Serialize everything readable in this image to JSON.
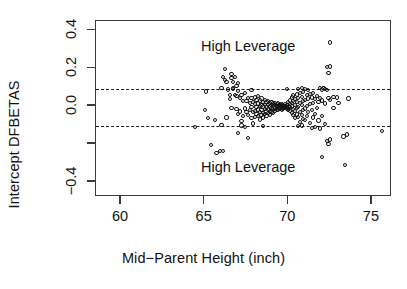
{
  "chart_data": {
    "type": "scatter",
    "title": "",
    "xlabel": "Mid−Parent Height (inch)",
    "ylabel": "Intercept DFBETAS",
    "xlim": [
      58.5,
      76.2
    ],
    "ylim": [
      -0.48,
      0.45
    ],
    "xticks": [
      60,
      65,
      70,
      75
    ],
    "xticklabels": [
      "60",
      "65",
      "70",
      "75"
    ],
    "yticks": [
      0.4,
      0.2,
      0.0,
      -0.2,
      -0.4
    ],
    "yticklabels": [
      "0.4",
      "0.2",
      "0.0",
      "",
      "−0.4"
    ],
    "grid": false,
    "legend": null,
    "marker": "open-circle",
    "annotations": [
      {
        "text": "High Leverage",
        "x": 67.6,
        "y": 0.315
      },
      {
        "text": "High Leverage",
        "x": 67.6,
        "y": -0.325
      }
    ],
    "reference_lines": [
      {
        "orientation": "horizontal",
        "y": 0.089,
        "style": "dashed"
      },
      {
        "orientation": "horizontal",
        "y": -0.104,
        "style": "dashed"
      }
    ],
    "points": [
      [
        64.4,
        -0.112
      ],
      [
        65.1,
        0.077
      ],
      [
        65.0,
        -0.021
      ],
      [
        65.2,
        -0.062
      ],
      [
        65.4,
        -0.205
      ],
      [
        65.6,
        -0.075
      ],
      [
        65.7,
        -0.247
      ],
      [
        65.9,
        -0.238
      ],
      [
        66.0,
        -0.098
      ],
      [
        66.1,
        -0.237
      ],
      [
        66.2,
        0.196
      ],
      [
        66.1,
        0.152
      ],
      [
        66.2,
        0.138
      ],
      [
        66.3,
        0.126
      ],
      [
        66.4,
        0.088
      ],
      [
        66.3,
        -0.06
      ],
      [
        66.5,
        0.06
      ],
      [
        66.6,
        0.17
      ],
      [
        66.6,
        0.15
      ],
      [
        66.5,
        0.036
      ],
      [
        66.6,
        -0.008
      ],
      [
        66.7,
        0.128
      ],
      [
        66.7,
        0.094
      ],
      [
        66.8,
        0.154
      ],
      [
        66.8,
        0.058
      ],
      [
        66.9,
        0.105
      ],
      [
        66.9,
        -0.016
      ],
      [
        67.0,
        0.082
      ],
      [
        67.0,
        -0.041
      ],
      [
        67.0,
        -0.14
      ],
      [
        67.1,
        0.044
      ],
      [
        67.1,
        -0.028
      ],
      [
        67.2,
        0.06
      ],
      [
        67.2,
        -0.078
      ],
      [
        67.3,
        0.026
      ],
      [
        67.3,
        -0.05
      ],
      [
        67.4,
        0.068
      ],
      [
        67.4,
        -0.012
      ],
      [
        67.4,
        -0.109
      ],
      [
        67.5,
        0.028
      ],
      [
        67.5,
        -0.03
      ],
      [
        67.6,
        0.044
      ],
      [
        67.6,
        -0.046
      ],
      [
        67.6,
        -0.17
      ],
      [
        67.7,
        0.016
      ],
      [
        67.7,
        -0.022
      ],
      [
        67.8,
        0.042
      ],
      [
        67.8,
        -0.006
      ],
      [
        67.8,
        -0.064
      ],
      [
        67.9,
        0.024
      ],
      [
        67.9,
        -0.032
      ],
      [
        67.9,
        -0.092
      ],
      [
        68.0,
        0.046
      ],
      [
        68.0,
        0.01
      ],
      [
        68.0,
        -0.024
      ],
      [
        68.0,
        -0.058
      ],
      [
        68.1,
        0.032
      ],
      [
        68.1,
        -0.004
      ],
      [
        68.1,
        -0.04
      ],
      [
        68.2,
        0.052
      ],
      [
        68.2,
        0.014
      ],
      [
        68.2,
        -0.018
      ],
      [
        68.2,
        -0.052
      ],
      [
        68.3,
        0.03
      ],
      [
        68.3,
        0.002
      ],
      [
        68.3,
        -0.03
      ],
      [
        68.3,
        -0.07
      ],
      [
        68.4,
        0.04
      ],
      [
        68.4,
        0.008
      ],
      [
        68.4,
        -0.02
      ],
      [
        68.4,
        -0.048
      ],
      [
        68.5,
        0.022
      ],
      [
        68.5,
        -0.002
      ],
      [
        68.5,
        -0.034
      ],
      [
        68.5,
        -0.06
      ],
      [
        68.6,
        0.034
      ],
      [
        68.6,
        0.006
      ],
      [
        68.6,
        -0.016
      ],
      [
        68.6,
        -0.042
      ],
      [
        68.7,
        0.02
      ],
      [
        68.7,
        -0.006
      ],
      [
        68.7,
        -0.028
      ],
      [
        68.7,
        -0.054
      ],
      [
        68.8,
        0.028
      ],
      [
        68.8,
        0.004
      ],
      [
        68.8,
        -0.018
      ],
      [
        68.8,
        -0.038
      ],
      [
        68.9,
        0.016
      ],
      [
        68.9,
        -0.002
      ],
      [
        68.9,
        -0.024
      ],
      [
        68.9,
        -0.046
      ],
      [
        69.0,
        0.022
      ],
      [
        69.0,
        0.006
      ],
      [
        69.0,
        -0.01
      ],
      [
        69.0,
        -0.03
      ],
      [
        69.1,
        0.014
      ],
      [
        69.1,
        0.0
      ],
      [
        69.1,
        -0.016
      ],
      [
        69.1,
        -0.034
      ],
      [
        69.2,
        0.018
      ],
      [
        69.2,
        0.004
      ],
      [
        69.2,
        -0.012
      ],
      [
        69.2,
        -0.026
      ],
      [
        69.3,
        0.012
      ],
      [
        69.3,
        -0.002
      ],
      [
        69.3,
        -0.018
      ],
      [
        69.4,
        0.014
      ],
      [
        69.4,
        0.002
      ],
      [
        69.4,
        -0.01
      ],
      [
        69.4,
        -0.022
      ],
      [
        69.5,
        0.01
      ],
      [
        69.5,
        0.0
      ],
      [
        69.5,
        -0.012
      ],
      [
        69.6,
        0.012
      ],
      [
        69.6,
        0.002
      ],
      [
        69.6,
        -0.008
      ],
      [
        69.6,
        -0.018
      ],
      [
        69.7,
        0.008
      ],
      [
        69.7,
        -0.002
      ],
      [
        69.7,
        -0.012
      ],
      [
        69.8,
        0.01
      ],
      [
        69.8,
        0.0
      ],
      [
        69.8,
        -0.01
      ],
      [
        69.9,
        0.008
      ],
      [
        69.9,
        -0.004
      ],
      [
        69.9,
        -0.014
      ],
      [
        70.0,
        0.02
      ],
      [
        70.0,
        0.004
      ],
      [
        70.0,
        -0.008
      ],
      [
        70.0,
        -0.02
      ],
      [
        70.1,
        0.03
      ],
      [
        70.1,
        0.01
      ],
      [
        70.1,
        -0.006
      ],
      [
        70.1,
        -0.026
      ],
      [
        70.2,
        0.046
      ],
      [
        70.2,
        0.018
      ],
      [
        70.2,
        -0.002
      ],
      [
        70.2,
        -0.034
      ],
      [
        70.3,
        0.056
      ],
      [
        70.3,
        0.026
      ],
      [
        70.3,
        -0.014
      ],
      [
        70.3,
        -0.048
      ],
      [
        70.4,
        0.038
      ],
      [
        70.4,
        0.008
      ],
      [
        70.4,
        -0.026
      ],
      [
        70.4,
        -0.062
      ],
      [
        70.5,
        0.062
      ],
      [
        70.5,
        0.022
      ],
      [
        70.5,
        -0.01
      ],
      [
        70.5,
        -0.044
      ],
      [
        70.6,
        0.09
      ],
      [
        70.6,
        0.042
      ],
      [
        70.6,
        -0.004
      ],
      [
        70.6,
        -0.056
      ],
      [
        70.7,
        0.068
      ],
      [
        70.7,
        0.016
      ],
      [
        70.7,
        -0.032
      ],
      [
        70.7,
        -0.084
      ],
      [
        70.8,
        0.05
      ],
      [
        70.8,
        0.006
      ],
      [
        70.8,
        -0.046
      ],
      [
        70.8,
        -0.102
      ],
      [
        70.9,
        0.074
      ],
      [
        70.9,
        0.028
      ],
      [
        70.9,
        -0.02
      ],
      [
        70.9,
        -0.068
      ],
      [
        71.0,
        0.092
      ],
      [
        71.0,
        0.034
      ],
      [
        71.0,
        -0.012
      ],
      [
        71.0,
        -0.074
      ],
      [
        71.1,
        0.058
      ],
      [
        71.1,
        0.002
      ],
      [
        71.1,
        -0.054
      ],
      [
        71.2,
        0.086
      ],
      [
        71.2,
        0.04
      ],
      [
        71.2,
        -0.03
      ],
      [
        71.3,
        0.064
      ],
      [
        71.3,
        0.012
      ],
      [
        71.3,
        -0.09
      ],
      [
        71.4,
        0.046
      ],
      [
        71.4,
        -0.022
      ],
      [
        71.4,
        -0.116
      ],
      [
        71.5,
        0.07
      ],
      [
        71.5,
        0.018
      ],
      [
        71.5,
        -0.06
      ],
      [
        71.6,
        0.036
      ],
      [
        71.6,
        -0.04
      ],
      [
        71.7,
        0.054
      ],
      [
        71.7,
        -0.01
      ],
      [
        71.8,
        0.024
      ],
      [
        71.8,
        -0.076
      ],
      [
        71.9,
        0.042
      ],
      [
        71.9,
        -0.118
      ],
      [
        72.0,
        0.088
      ],
      [
        72.0,
        0.03
      ],
      [
        72.0,
        -0.05
      ],
      [
        72.0,
        -0.268
      ],
      [
        72.2,
        0.092
      ],
      [
        72.2,
        0.014
      ],
      [
        72.2,
        -0.096
      ],
      [
        72.3,
        0.206
      ],
      [
        72.3,
        0.084
      ],
      [
        72.3,
        -0.186
      ],
      [
        72.4,
        0.176
      ],
      [
        72.4,
        0.042
      ],
      [
        72.4,
        -0.198
      ],
      [
        72.5,
        0.336
      ],
      [
        72.5,
        0.21
      ],
      [
        72.5,
        0.034
      ],
      [
        72.5,
        -0.176
      ],
      [
        72.7,
        0.05
      ],
      [
        72.7,
        -0.01
      ],
      [
        72.9,
        0.046
      ],
      [
        73.0,
        0.016
      ],
      [
        73.3,
        -0.16
      ],
      [
        73.4,
        -0.31
      ],
      [
        73.5,
        -0.15
      ],
      [
        73.6,
        0.04
      ],
      [
        75.6,
        -0.132
      ],
      [
        66.0,
        0.094
      ],
      [
        66.9,
        0.052
      ],
      [
        67.0,
        0.122
      ],
      [
        71.9,
        0.096
      ],
      [
        70.8,
        0.096
      ],
      [
        72.1,
        0.098
      ],
      [
        66.7,
        0.09
      ],
      [
        67.8,
        0.086
      ],
      [
        69.9,
        0.09
      ],
      [
        68.5,
        -0.104
      ],
      [
        70.6,
        -0.106
      ],
      [
        71.6,
        -0.108
      ],
      [
        67.2,
        -0.102
      ]
    ]
  }
}
